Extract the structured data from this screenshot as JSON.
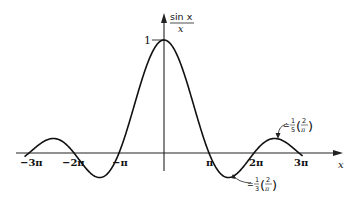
{
  "chart_data": {
    "type": "line",
    "title": "",
    "function": "sin x / x",
    "xlabel": "x",
    "ylabel": "sin x / x",
    "ylabel_num": "sin x",
    "ylabel_den": "x",
    "xlim": [
      -3.1,
      3.4
    ],
    "xlim_units": "pi",
    "ylim": [
      -0.25,
      1.15
    ],
    "grid": false,
    "x_ticks": [
      "−3π",
      "−2π",
      "−π",
      "π",
      "2π",
      "3π"
    ],
    "x_tick_values": [
      -3,
      -2,
      -1,
      1,
      2,
      3
    ],
    "y_ticks": [
      "1"
    ],
    "y_tick_values": [
      1
    ],
    "annotations": [
      {
        "text": "≐ 1/3 (2/π)",
        "prefix": "≐",
        "frac_num": "1",
        "frac_den": "3",
        "paren_num": "2",
        "paren_den": "π",
        "x": 1.5,
        "y": -0.212
      },
      {
        "text": "≐ 1/5 (2/π)",
        "prefix": "≐",
        "frac_num": "1",
        "frac_den": "5",
        "paren_num": "2",
        "paren_den": "π",
        "x": 2.5,
        "y": 0.127
      }
    ],
    "series": [
      {
        "name": "sin x / x",
        "x": [
          -3,
          -2.5,
          -2,
          -1.5,
          -1,
          -0.5,
          0,
          0.5,
          1,
          1.5,
          2,
          2.5,
          3
        ],
        "values": [
          0,
          0.127,
          0,
          -0.212,
          0,
          0.637,
          1,
          0.637,
          0,
          -0.212,
          0,
          0.127,
          0
        ]
      }
    ]
  }
}
